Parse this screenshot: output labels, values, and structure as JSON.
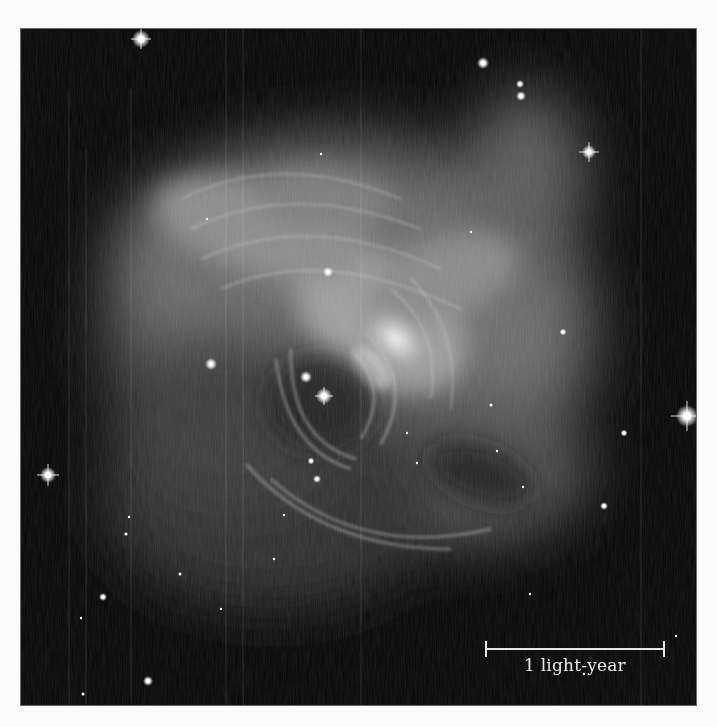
{
  "figure": {
    "style": "grayscale astronomical photograph",
    "colors": {
      "page_background": "#fbfbfb",
      "sky_background": "#050505",
      "frame_border": "#6a6a6a",
      "scale_bar": "#e6e6e6",
      "label_text": "#ececec"
    }
  },
  "scale_bar": {
    "label": "1 light-year",
    "icon": "scale-bar-icon"
  },
  "stars": [
    {
      "x": 120,
      "y": 10,
      "r": 5,
      "spikes": true
    },
    {
      "x": 462,
      "y": 34,
      "r": 3.5,
      "spikes": false
    },
    {
      "x": 499,
      "y": 55,
      "r": 2.5,
      "spikes": false
    },
    {
      "x": 500,
      "y": 67,
      "r": 3,
      "spikes": false
    },
    {
      "x": 568,
      "y": 123,
      "r": 4,
      "spikes": true
    },
    {
      "x": 666,
      "y": 387,
      "r": 6,
      "spikes": true
    },
    {
      "x": 27,
      "y": 446,
      "r": 4.5,
      "spikes": true
    },
    {
      "x": 190,
      "y": 335,
      "r": 3.5,
      "spikes": false
    },
    {
      "x": 285,
      "y": 348,
      "r": 3.5,
      "spikes": false
    },
    {
      "x": 303,
      "y": 367,
      "r": 4.5,
      "spikes": false
    },
    {
      "x": 296,
      "y": 450,
      "r": 2.5,
      "spikes": false
    },
    {
      "x": 290,
      "y": 432,
      "r": 2,
      "spikes": false
    },
    {
      "x": 307,
      "y": 243,
      "r": 3,
      "spikes": false
    },
    {
      "x": 186,
      "y": 190,
      "r": 1.5,
      "spikes": false
    },
    {
      "x": 300,
      "y": 125,
      "r": 1.5,
      "spikes": false
    },
    {
      "x": 450,
      "y": 203,
      "r": 1.5,
      "spikes": false
    },
    {
      "x": 542,
      "y": 303,
      "r": 2,
      "spikes": false
    },
    {
      "x": 583,
      "y": 477,
      "r": 2.5,
      "spikes": false
    },
    {
      "x": 603,
      "y": 404,
      "r": 2,
      "spikes": false
    },
    {
      "x": 470,
      "y": 376,
      "r": 2,
      "spikes": false
    },
    {
      "x": 476,
      "y": 422,
      "r": 1.5,
      "spikes": false
    },
    {
      "x": 396,
      "y": 434,
      "r": 1.5,
      "spikes": false
    },
    {
      "x": 386,
      "y": 404,
      "r": 1.5,
      "spikes": false
    },
    {
      "x": 108,
      "y": 488,
      "r": 1.5,
      "spikes": false
    },
    {
      "x": 105,
      "y": 505,
      "r": 2,
      "spikes": false
    },
    {
      "x": 82,
      "y": 568,
      "r": 2.5,
      "spikes": false
    },
    {
      "x": 159,
      "y": 545,
      "r": 2,
      "spikes": false
    },
    {
      "x": 200,
      "y": 580,
      "r": 1.5,
      "spikes": false
    },
    {
      "x": 127,
      "y": 652,
      "r": 3,
      "spikes": false
    },
    {
      "x": 263,
      "y": 486,
      "r": 1.5,
      "spikes": false
    },
    {
      "x": 253,
      "y": 530,
      "r": 1.5,
      "spikes": false
    },
    {
      "x": 60,
      "y": 589,
      "r": 1.5,
      "spikes": false
    },
    {
      "x": 502,
      "y": 458,
      "r": 1.5,
      "spikes": false
    },
    {
      "x": 655,
      "y": 607,
      "r": 1.5,
      "spikes": false
    },
    {
      "x": 563,
      "y": 645,
      "r": 1.5,
      "spikes": false
    },
    {
      "x": 509,
      "y": 565,
      "r": 1.5,
      "spikes": false
    },
    {
      "x": 62,
      "y": 665,
      "r": 2,
      "spikes": false
    }
  ]
}
